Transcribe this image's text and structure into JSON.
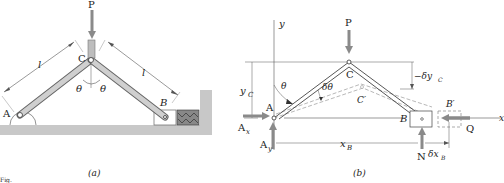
{
  "figure_a": {
    "caption": "(a)",
    "labels": {
      "force_p": "P",
      "joint_a": "A",
      "joint_b": "B",
      "joint_c": "C",
      "length_left": "l",
      "length_right": "l",
      "theta_left": "θ",
      "theta_right": "θ"
    }
  },
  "figure_b": {
    "caption": "(b)",
    "labels": {
      "axis_y": "y",
      "axis_x": "x",
      "force_p": "P",
      "joint_a": "A",
      "joint_b": "B",
      "joint_c": "C",
      "joint_c_prime": "C′",
      "joint_b_prime": "B′",
      "reaction_ax": "A",
      "reaction_ax_sub": "x",
      "reaction_ay": "A",
      "reaction_ay_sub": "y",
      "force_q": "Q",
      "force_n": "N",
      "theta": "θ",
      "delta_theta": "δθ",
      "y_c": "y",
      "y_c_sub": "C",
      "x_b": "x",
      "x_b_sub": "B",
      "delta_y_c": "−δy",
      "delta_y_c_sub": "C",
      "delta_x_b": "δx",
      "delta_x_b_sub": "B"
    }
  },
  "figure_number": "Fig."
}
